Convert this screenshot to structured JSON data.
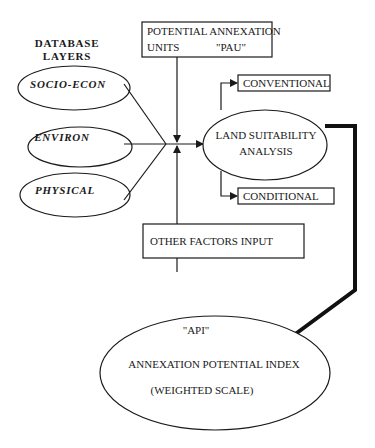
{
  "diagram": {
    "header": {
      "line1": "DATABASE",
      "line2": "LAYERS"
    },
    "layers": [
      {
        "label": "SOCIO-ECON"
      },
      {
        "label": "ENVIRON"
      },
      {
        "label": "PHYSICAL"
      }
    ],
    "pau_box": {
      "line1": "POTENTIAL ANNEXATION",
      "line2_left": "UNITS",
      "line2_right": "\"PAU\""
    },
    "analysis": {
      "line1": "LAND SUITABILITY",
      "line2": "ANALYSIS"
    },
    "outputs": {
      "conventional": "CONVENTIONAL",
      "conditional": "CONDITIONAL"
    },
    "other_factors": "OTHER FACTORS INPUT",
    "result": {
      "line1": "\"API\"",
      "line2": "ANNEXATION POTENTIAL INDEX",
      "line3": "(WEIGHTED SCALE)"
    },
    "colors": {
      "stroke": "#1a1a1a",
      "background": "#ffffff"
    }
  }
}
